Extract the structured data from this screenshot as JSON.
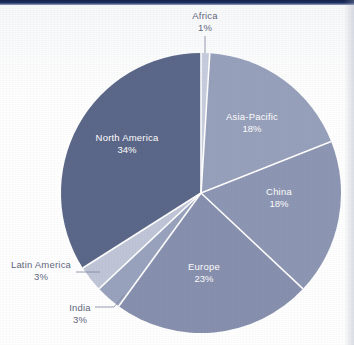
{
  "chart_data": {
    "type": "pie",
    "title": "",
    "subtitle": "",
    "xlabel": "",
    "ylabel": "",
    "legend_position": "none",
    "grid": false,
    "value_suffix": "%",
    "start_angle_deg": 0,
    "direction": "clockwise",
    "categories": [
      "Africa",
      "Asia-Pacific",
      "China",
      "Europe",
      "India",
      "Latin America",
      "North America"
    ],
    "values": [
      1,
      18,
      18,
      23,
      3,
      3,
      34
    ],
    "slices": [
      {
        "name": "Africa",
        "label": "Africa",
        "value": 1,
        "value_label": "1%",
        "color": "#c7cdde",
        "label_placement": "outside",
        "label_x": 205,
        "label_y": 19,
        "value_x": 205,
        "value_y": 31,
        "text_anchor": "middle",
        "leader": "M 205,36 L 205,53"
      },
      {
        "name": "Asia-Pacific",
        "label": "Asia-Pacific",
        "value": 18,
        "value_label": "18%",
        "color": "#98a1bc",
        "label_placement": "inside",
        "label_x": 252,
        "label_y": 120,
        "value_x": 252,
        "value_y": 132
      },
      {
        "name": "China",
        "label": "China",
        "value": 18,
        "value_label": "18%",
        "color": "#8d97b3",
        "label_placement": "inside",
        "label_x": 279,
        "label_y": 195,
        "value_x": 279,
        "value_y": 207
      },
      {
        "name": "Europe",
        "label": "Europe",
        "value": 23,
        "value_label": "23%",
        "color": "#8790ae",
        "label_placement": "inside",
        "label_x": 204,
        "label_y": 270,
        "value_x": 204,
        "value_y": 282
      },
      {
        "name": "India",
        "label": "India",
        "value": 3,
        "value_label": "3%",
        "color": "#9aa3be",
        "label_placement": "outside",
        "label_x": 80,
        "label_y": 311,
        "value_x": 80,
        "value_y": 323,
        "text_anchor": "middle",
        "leader": "M 95,307 L 114,307 L 124,295"
      },
      {
        "name": "Latin America",
        "label": "Latin America",
        "value": 3,
        "value_label": "3%",
        "color": "#c0c6d8",
        "label_placement": "outside",
        "label_x": 41,
        "label_y": 268,
        "value_x": 41,
        "value_y": 280,
        "text_anchor": "middle",
        "leader": "M 76,272 L 100,272"
      },
      {
        "name": "North America",
        "label": "North America",
        "value": 34,
        "value_label": "34%",
        "color": "#5c6889",
        "label_placement": "inside",
        "label_x": 127,
        "label_y": 141,
        "value_x": 127,
        "value_y": 153
      }
    ],
    "geometry": {
      "center_x": 201,
      "center_y": 193,
      "radius": 140
    },
    "colors": {
      "darkest": "#5c6889",
      "mid": "#8790ae",
      "light": "#98a1bc",
      "lightest": "#c7cdde",
      "label_text": "#5f6880",
      "slice_text": "#ffffff",
      "separator": "#ffffff",
      "top_bar": "#14224c",
      "background": "#ffffff"
    }
  }
}
